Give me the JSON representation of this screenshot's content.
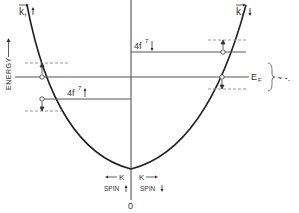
{
  "diagram": {
    "axis_label_energy": "ENERGY",
    "label_k_spin_up": "k,",
    "label_k_spin_down": "k,",
    "label_fermi": "E",
    "label_fermi_sub": "F",
    "label_4f7_upper": "4f",
    "label_4f7_lower": "4f",
    "superscript_7": "7",
    "label_k_left": "K",
    "label_k_right": "K",
    "label_spin_up": "SPIN",
    "label_spin_down": "SPIN",
    "label_origin": "0",
    "trailing_mark": "~ -."
  },
  "colors": {
    "line": "#333333",
    "dash": "#999999"
  }
}
